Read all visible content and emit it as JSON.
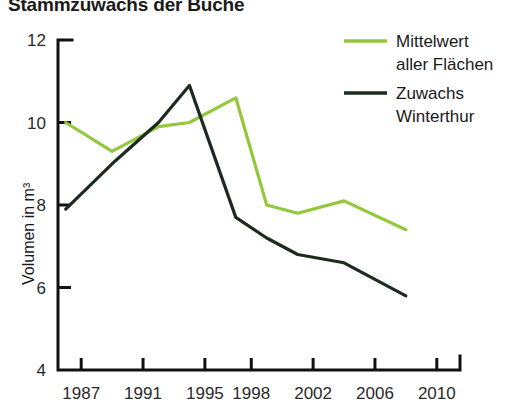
{
  "chart_data": {
    "type": "line",
    "title": "Stammzuwachs der Buche",
    "xlabel": "",
    "ylabel": "Volumen in m³",
    "ylim": [
      4,
      12
    ],
    "yticks": [
      4,
      6,
      8,
      10,
      12
    ],
    "ytick_labels": [
      "4",
      "6",
      "8",
      "10",
      "12"
    ],
    "xlim": [
      1985.5,
      2011.5
    ],
    "xticks": [
      1987,
      1991,
      1995,
      1998,
      2002,
      2006,
      2010
    ],
    "xtick_labels": [
      "1987",
      "1991",
      "1995",
      "1998",
      "2002",
      "2006",
      "2010"
    ],
    "grid": false,
    "legend_position": "top-right",
    "x": [
      1986,
      1989,
      1992,
      1994,
      1997,
      1999,
      2001,
      2004,
      2008
    ],
    "series": [
      {
        "name": "Mittelwert aller Flächen",
        "color": "#93C83D",
        "values": [
          10.0,
          9.3,
          9.9,
          10.0,
          10.6,
          8.0,
          7.8,
          8.1,
          7.4
        ]
      },
      {
        "name": "Zuwachs Winterthur",
        "color": "#1C2B1E",
        "values": [
          7.9,
          9.0,
          10.0,
          10.9,
          7.7,
          7.2,
          6.8,
          6.6,
          5.8
        ]
      }
    ]
  },
  "legend": {
    "entries": [
      {
        "line1": "Mittelwert",
        "line2": "aller Flächen"
      },
      {
        "line1": "Zuwachs",
        "line2": "Winterthur"
      }
    ]
  }
}
